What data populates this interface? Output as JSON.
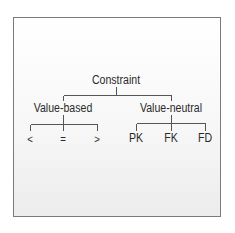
{
  "diagram": {
    "type": "tree",
    "root": {
      "label": "Constraint",
      "children": [
        {
          "label": "Value-based",
          "children": [
            {
              "label": "<"
            },
            {
              "label": "="
            },
            {
              "label": ">"
            }
          ]
        },
        {
          "label": "Value-neutral",
          "children": [
            {
              "label": "PK"
            },
            {
              "label": "FK"
            },
            {
              "label": "FD"
            }
          ]
        }
      ]
    },
    "colors": {
      "line": "#555555",
      "text": "#2a2a2a",
      "border": "#7a7a7a"
    }
  }
}
